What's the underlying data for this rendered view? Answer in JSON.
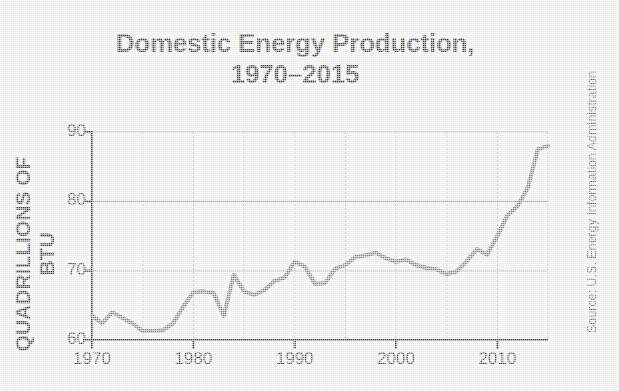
{
  "title": {
    "line1": "Domestic Energy Production,",
    "line2": "1970–2015"
  },
  "source_note": "Source: U.S. Energy Information Administration",
  "colors": {
    "background": "#efefed",
    "line": "#8c8c8c",
    "axis": "#4a4a4a",
    "gridline": "#a9a9a9",
    "text": "#4a4a4a"
  },
  "chart_data": {
    "type": "line",
    "title": "Domestic Energy Production, 1970–2015",
    "subtitle": "",
    "xlabel": "",
    "ylabel": "QUADRILLIONS OF BTU",
    "xlim": [
      1970,
      2015
    ],
    "ylim": [
      60,
      90
    ],
    "yticks": [
      60,
      70,
      80,
      90
    ],
    "ytick_labels": [
      "60",
      "70",
      "80",
      "90"
    ],
    "xticks": [
      1970,
      1980,
      1990,
      2000,
      2010
    ],
    "xtick_labels": [
      "1970",
      "1980",
      "1990",
      "2000",
      "2010"
    ],
    "grid": {
      "horizontal": "solid, at 70/80/90",
      "vertical": "dotted, every 5 years (1975, 1980, 1985, 1990, 1995, 2000, 2005, 2010, 2015)",
      "vertical_positions": [
        1975,
        1980,
        1985,
        1990,
        1995,
        2000,
        2005,
        2010,
        2015
      ]
    },
    "legend": "none",
    "units": "quadrillion BTU",
    "series": [
      {
        "name": "Domestic Energy Production",
        "x": [
          1970,
          1971,
          1972,
          1973,
          1974,
          1975,
          1976,
          1977,
          1978,
          1979,
          1980,
          1981,
          1982,
          1983,
          1984,
          1985,
          1986,
          1987,
          1988,
          1989,
          1990,
          1991,
          1992,
          1993,
          1994,
          1995,
          1996,
          1997,
          1998,
          1999,
          2000,
          2001,
          2002,
          2003,
          2004,
          2005,
          2006,
          2007,
          2008,
          2009,
          2010,
          2011,
          2012,
          2013,
          2014,
          2015
        ],
        "values": [
          63.5,
          62.4,
          64.0,
          63.2,
          62.4,
          61.3,
          61.3,
          61.4,
          62.4,
          64.8,
          66.9,
          67.0,
          66.8,
          63.5,
          69.4,
          67.0,
          66.5,
          67.2,
          68.5,
          69.0,
          71.3,
          70.6,
          68.1,
          68.2,
          70.3,
          70.8,
          72.0,
          72.2,
          72.6,
          71.8,
          71.3,
          71.6,
          70.8,
          70.4,
          70.2,
          69.5,
          69.9,
          71.4,
          73.1,
          72.3,
          75.0,
          78.0,
          79.3,
          82.0,
          87.5,
          88.0
        ]
      }
    ]
  }
}
